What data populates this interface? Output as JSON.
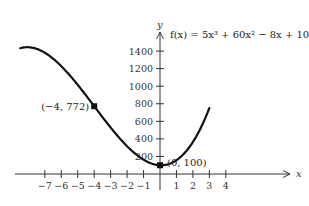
{
  "chart_data": {
    "type": "line",
    "title": "",
    "function_label": "f(x) = 5x³ + 60x² − 8x + 100",
    "function": {
      "a3": 5,
      "a2": 60,
      "a1": -8,
      "a0": 100
    },
    "xlabel": "x",
    "ylabel": "y",
    "x_domain_plotted": [
      -8.5,
      3.0
    ],
    "xlim": [
      -9,
      5
    ],
    "ylim": [
      0,
      1500
    ],
    "x_ticks": [
      -7,
      -6,
      -5,
      -4,
      -3,
      -2,
      -1,
      1,
      2,
      3,
      4
    ],
    "x_tick_labels": [
      "−7",
      "−6",
      "−5",
      "−4",
      "−3",
      "−2",
      "−1",
      "1",
      "2",
      "3",
      "4"
    ],
    "y_ticks": [
      200,
      400,
      600,
      800,
      1000,
      1200,
      1400
    ],
    "y_tick_labels": [
      "200",
      "400",
      "600",
      "800",
      "1000",
      "1200",
      "1400"
    ],
    "grid": false,
    "legend": null,
    "marked_points": [
      {
        "x": -4,
        "y": 772,
        "label": "(−4, 772)",
        "label_side": "left"
      },
      {
        "x": 0,
        "y": 100,
        "label": "(0, 100)",
        "label_side": "right"
      }
    ],
    "sampled_curve": {
      "x": [
        -8.5,
        -8,
        -7,
        -6,
        -5,
        -4,
        -3,
        -2,
        -1,
        -0.5,
        0,
        1,
        2,
        3
      ],
      "y": [
        1401.9,
        1404,
        1301,
        1088,
        833,
        772,
        469,
        276,
        163,
        118.4,
        100,
        157,
        396,
        916
      ]
    }
  },
  "layout": {
    "origin_px": [
      160,
      174
    ],
    "px_per_x": 16.45,
    "px_per_y": 0.0878,
    "x_axis_px": [
      15,
      290
    ],
    "y_axis_px": [
      32,
      190
    ],
    "line_color": "#111111",
    "axis_color": "#333333"
  }
}
